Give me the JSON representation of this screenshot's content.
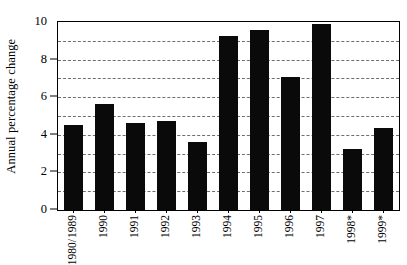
{
  "chart_data": {
    "type": "bar",
    "title": "",
    "subtitle": "",
    "xlabel": "",
    "ylabel": "Annual percentage change",
    "categories": [
      "1980/ 1989",
      "1990",
      "1991",
      "1992",
      "1993",
      "1994",
      "1995",
      "1996",
      "1997",
      "1998*",
      "1999*"
    ],
    "category_lines": [
      [
        "1980/",
        "1989"
      ],
      [
        "1990"
      ],
      [
        "1991"
      ],
      [
        "1992"
      ],
      [
        "1993"
      ],
      [
        "1994"
      ],
      [
        "1995"
      ],
      [
        "1996"
      ],
      [
        "1997"
      ],
      [
        "1998*"
      ],
      [
        "1999*"
      ]
    ],
    "values": [
      4.5,
      5.65,
      4.65,
      4.75,
      3.6,
      9.25,
      9.55,
      7.05,
      9.9,
      3.25,
      4.35
    ],
    "ylim": [
      0,
      10
    ],
    "xlim_note": "categorical",
    "y_major_ticks": [
      0,
      2,
      4,
      6,
      8,
      10
    ],
    "y_gridlines": [
      1,
      2,
      3,
      4,
      5,
      6,
      7,
      8,
      9
    ],
    "grid": "horizontal-dashed",
    "legend": "none",
    "legend_position": "none",
    "annotations": [
      "* denotes projected/estimated values for 1998 and 1999"
    ],
    "bar_color": "#0a0a0a",
    "grid_color": "#6e6e6e",
    "axis_color": "#000000",
    "background_color": "#ffffff"
  },
  "axes": {
    "y_tick_labels": [
      "0",
      "2",
      "4",
      "6",
      "8",
      "10"
    ],
    "y_title": "Annual percentage change"
  }
}
